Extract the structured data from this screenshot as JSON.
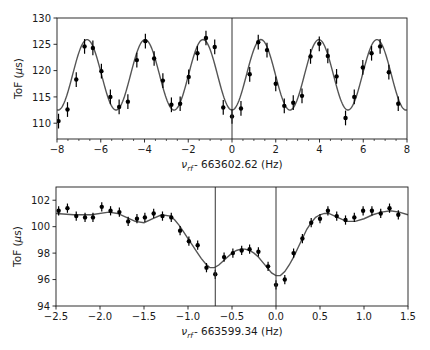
{
  "chart_data": [
    {
      "type": "scatter",
      "panel": "top",
      "title": "",
      "xlabel": "ν_rf - 663602.62 (Hz)",
      "xlabel_parts": {
        "nu": "ν",
        "sub": "rf",
        "rest": "- 663602.62 (Hz)"
      },
      "ylabel": "ToF (μs)",
      "ylabel_parts": {
        "pre": "ToF (",
        "mu": "μ",
        "post": "s)"
      },
      "xlim": [
        -8,
        8
      ],
      "ylim": [
        107,
        130
      ],
      "xticks": [
        -8,
        -6,
        -4,
        -2,
        0,
        2,
        4,
        6,
        8
      ],
      "xtick_labels": [
        "−8",
        "−6",
        "−4",
        "−2",
        "0",
        "2",
        "4",
        "6",
        "8"
      ],
      "xminor_step": 0.5,
      "yticks": [
        110,
        115,
        120,
        125,
        130
      ],
      "ytick_labels": [
        "110",
        "115",
        "120",
        "125",
        "130"
      ],
      "grid": false,
      "legend": null,
      "vlines": [
        0
      ],
      "series": [
        {
          "name": "data",
          "style": "errorbar",
          "x": [
            -7.93,
            -7.52,
            -7.12,
            -6.74,
            -6.36,
            -5.97,
            -5.56,
            -5.16,
            -4.76,
            -4.35,
            -3.96,
            -3.56,
            -3.16,
            -2.77,
            -2.37,
            -1.98,
            -1.58,
            -1.19,
            -0.79,
            -0.4,
            0.0,
            0.41,
            0.81,
            1.2,
            1.6,
            2.0,
            2.39,
            2.8,
            3.2,
            3.59,
            3.99,
            4.38,
            4.78,
            5.19,
            5.59,
            5.98,
            6.38,
            6.77,
            7.17,
            7.6
          ],
          "y": [
            110.4,
            112.6,
            118.3,
            124.6,
            124.3,
            119.9,
            115.0,
            113.1,
            114.1,
            122.0,
            125.6,
            122.3,
            118.1,
            113.5,
            113.7,
            118.8,
            123.3,
            126.2,
            124.5,
            113.0,
            111.3,
            112.8,
            119.3,
            125.4,
            123.9,
            117.5,
            113.3,
            113.9,
            115.2,
            122.7,
            125.1,
            122.8,
            118.9,
            111.0,
            115.0,
            120.6,
            123.3,
            124.6,
            119.7,
            113.7
          ],
          "yerr": 1.4
        },
        {
          "name": "fit",
          "style": "line",
          "model": "offset - amplitude*cos(2*pi*x/period)",
          "offset": 119.2,
          "amplitude": 6.7,
          "period": 2.65
        }
      ]
    },
    {
      "type": "scatter",
      "panel": "bottom",
      "title": "",
      "xlabel": "ν_rf - 663599.34 (Hz)",
      "xlabel_parts": {
        "nu": "ν",
        "sub": "rf",
        "rest": "- 663599.34 (Hz)"
      },
      "ylabel": "ToF (μs)",
      "ylabel_parts": {
        "pre": "ToF (",
        "mu": "μ",
        "post": "s)"
      },
      "xlim": [
        -2.5,
        1.5
      ],
      "ylim": [
        94,
        103
      ],
      "xticks": [
        -2.5,
        -2.0,
        -1.5,
        -1.0,
        -0.5,
        0.0,
        0.5,
        1.0,
        1.5
      ],
      "xtick_labels": [
        "−2.5",
        "−2.0",
        "−1.5",
        "−1.0",
        "−0.5",
        "0.0",
        "0.5",
        "1.0",
        "1.5"
      ],
      "yticks": [
        94,
        96,
        98,
        100,
        102
      ],
      "ytick_labels": [
        "94",
        "96",
        "98",
        "100",
        "102"
      ],
      "grid": false,
      "legend": null,
      "vlines": [
        -0.69,
        0.0
      ],
      "series": [
        {
          "name": "data",
          "style": "errorbar",
          "x": [
            -2.47,
            -2.37,
            -2.27,
            -2.17,
            -2.08,
            -1.98,
            -1.88,
            -1.78,
            -1.68,
            -1.58,
            -1.49,
            -1.39,
            -1.29,
            -1.19,
            -1.09,
            -0.99,
            -0.89,
            -0.79,
            -0.69,
            -0.59,
            -0.49,
            -0.39,
            -0.3,
            -0.2,
            -0.09,
            0.0,
            0.1,
            0.2,
            0.3,
            0.4,
            0.5,
            0.59,
            0.69,
            0.79,
            0.89,
            0.99,
            1.09,
            1.19,
            1.29,
            1.39
          ],
          "y": [
            101.2,
            101.4,
            100.8,
            100.7,
            100.7,
            101.5,
            101.2,
            101.1,
            100.4,
            100.6,
            100.7,
            101.0,
            100.8,
            100.7,
            99.7,
            98.9,
            98.6,
            96.9,
            96.4,
            97.7,
            98.0,
            98.2,
            98.3,
            98.1,
            97.0,
            95.6,
            96.0,
            98.0,
            99.1,
            100.3,
            100.6,
            101.2,
            100.8,
            100.5,
            100.7,
            101.2,
            101.2,
            101.0,
            101.4,
            100.9
          ],
          "yerr": 0.35
        },
        {
          "name": "fit",
          "style": "line",
          "x": [
            -2.5,
            -2.3,
            -2.1,
            -1.9,
            -1.8,
            -1.7,
            -1.6,
            -1.5,
            -1.4,
            -1.3,
            -1.2,
            -1.15,
            -1.1,
            -1.05,
            -1.0,
            -0.95,
            -0.9,
            -0.85,
            -0.8,
            -0.75,
            -0.7,
            -0.65,
            -0.6,
            -0.55,
            -0.5,
            -0.45,
            -0.4,
            -0.35,
            -0.3,
            -0.25,
            -0.2,
            -0.15,
            -0.1,
            -0.05,
            0.0,
            0.05,
            0.1,
            0.15,
            0.2,
            0.25,
            0.3,
            0.35,
            0.4,
            0.45,
            0.5,
            0.55,
            0.6,
            0.7,
            0.8,
            0.9,
            1.0,
            1.1,
            1.2,
            1.3,
            1.4,
            1.5
          ],
          "y": [
            101.0,
            100.9,
            100.9,
            101.1,
            101.0,
            100.7,
            100.4,
            100.3,
            100.6,
            100.9,
            100.8,
            100.5,
            100.1,
            99.6,
            99.1,
            98.6,
            98.1,
            97.6,
            97.2,
            96.9,
            96.9,
            97.1,
            97.4,
            97.7,
            98.0,
            98.2,
            98.3,
            98.3,
            98.2,
            98.0,
            97.7,
            97.3,
            96.9,
            96.5,
            96.3,
            96.3,
            96.6,
            97.1,
            97.7,
            98.4,
            99.1,
            99.8,
            100.3,
            100.7,
            100.9,
            101.0,
            101.0,
            100.7,
            100.4,
            100.4,
            100.6,
            100.9,
            101.1,
            101.2,
            101.1,
            100.9
          ]
        }
      ]
    }
  ],
  "layout": {
    "width": 430,
    "height": 350,
    "axes": [
      {
        "left": 57,
        "right": 407,
        "top": 18,
        "bottom": 139
      },
      {
        "left": 56,
        "right": 408,
        "top": 187,
        "bottom": 306
      }
    ],
    "colors": {
      "axis": "#1a1a1a",
      "data": "#000000",
      "fit": "#555555",
      "vline": "#333333",
      "background": "#ffffff"
    }
  }
}
